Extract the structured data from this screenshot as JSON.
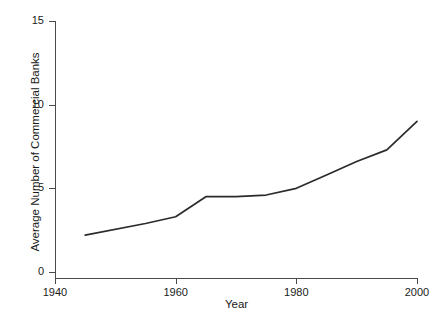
{
  "chart_data": {
    "type": "line",
    "title": "",
    "xlabel": "Year",
    "ylabel": "Average Number of Commercial Banks",
    "xlim": [
      1940,
      2002
    ],
    "ylim": [
      0,
      15.5
    ],
    "xticks": [
      1940,
      1960,
      1980,
      2000
    ],
    "xtick_labels": [
      "1940",
      "1960",
      "1980",
      "2000"
    ],
    "yticks": [
      0,
      5,
      10,
      15
    ],
    "ytick_labels": [
      "0",
      "5",
      "10",
      "15"
    ],
    "grid": false,
    "legend": false,
    "line_color": "#2b2b2b",
    "axis_color": "#4a4a4a",
    "series": [
      {
        "name": "Average Number of Commercial Banks",
        "x": [
          1945,
          1955,
          1960,
          1965,
          1970,
          1975,
          1980,
          1985,
          1990,
          1995,
          2000
        ],
        "values": [
          2.2,
          2.9,
          3.3,
          4.5,
          4.5,
          4.6,
          5.0,
          5.8,
          6.6,
          7.3,
          9.0
        ]
      }
    ]
  }
}
